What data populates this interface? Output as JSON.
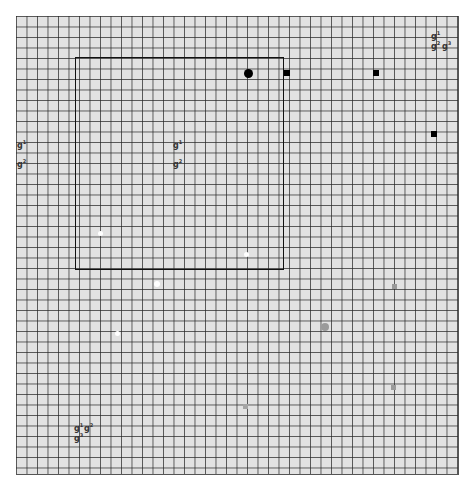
{
  "board": {
    "cell_size_px": 10.5,
    "origin": [
      16,
      16
    ],
    "size": [
      442,
      458
    ],
    "background": "#e2e2e2",
    "line_color": "#333333"
  },
  "regions": [
    {
      "name": "selection-rectangle",
      "x": 75,
      "y": 57,
      "w": 209,
      "h": 213,
      "color": "#111111"
    }
  ],
  "markers": [
    {
      "name": "black-circle",
      "shape": "circle",
      "x": 248,
      "y": 73,
      "size": 9,
      "color": "#000000"
    },
    {
      "name": "black-square",
      "shape": "square",
      "x": 287,
      "y": 73,
      "size": 6,
      "color": "#000000"
    },
    {
      "name": "black-square",
      "shape": "square",
      "x": 376,
      "y": 73,
      "size": 6,
      "color": "#000000"
    },
    {
      "name": "black-square",
      "shape": "square",
      "x": 434,
      "y": 134,
      "size": 6,
      "color": "#000000"
    },
    {
      "name": "white-dot",
      "shape": "circle",
      "x": 100,
      "y": 233,
      "size": 5,
      "color": "#ffffff"
    },
    {
      "name": "white-dot",
      "shape": "circle",
      "x": 246,
      "y": 254,
      "size": 5,
      "color": "#ffffff"
    },
    {
      "name": "white-dot",
      "shape": "circle",
      "x": 157,
      "y": 284,
      "size": 6,
      "color": "#ffffff"
    },
    {
      "name": "white-dot",
      "shape": "circle",
      "x": 117,
      "y": 333,
      "size": 5,
      "color": "#ffffff"
    },
    {
      "name": "grey-circle",
      "shape": "circle",
      "x": 325,
      "y": 327,
      "size": 8,
      "color": "#9a9a9a"
    },
    {
      "name": "grey-square",
      "shape": "square",
      "x": 394,
      "y": 286,
      "size": 5,
      "color": "#9a9a9a"
    },
    {
      "name": "grey-square",
      "shape": "square",
      "x": 393,
      "y": 387,
      "size": 5,
      "color": "#9a9a9a"
    },
    {
      "name": "grey-square",
      "shape": "square",
      "x": 245,
      "y": 406,
      "size": 5,
      "color": "#a5a5a5"
    }
  ],
  "glyphs": [
    {
      "text": "g",
      "sup": "1",
      "x": 431,
      "y": 29
    },
    {
      "text": "g",
      "sup": "2",
      "x": 431,
      "y": 39
    },
    {
      "text": "g",
      "sup": "3",
      "x": 442,
      "y": 39
    },
    {
      "text": "g",
      "sup": "1",
      "x": 17,
      "y": 138
    },
    {
      "text": "g",
      "sup": "2",
      "x": 17,
      "y": 157
    },
    {
      "text": "g",
      "sup": "1",
      "x": 173,
      "y": 138
    },
    {
      "text": "g",
      "sup": "2",
      "x": 173,
      "y": 157
    },
    {
      "text": "g",
      "sup": "1",
      "x": 74,
      "y": 421
    },
    {
      "text": "g",
      "sup": "2",
      "x": 84,
      "y": 421
    },
    {
      "text": "g",
      "sup": "3",
      "x": 74,
      "y": 431
    }
  ],
  "caption": {
    "text": ""
  }
}
